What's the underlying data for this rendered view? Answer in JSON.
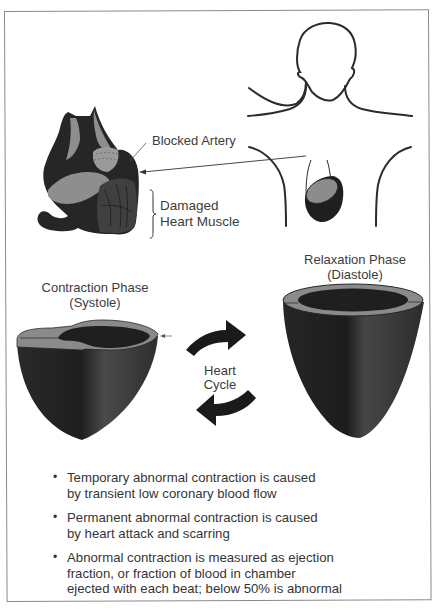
{
  "figure": {
    "labels": {
      "blocked_artery": "Blocked Artery",
      "damaged_heart_muscle": [
        "Damaged",
        "Heart Muscle"
      ],
      "contraction_phase": [
        "Contraction Phase",
        "(Systole)"
      ],
      "relaxation_phase": [
        "Relaxation Phase",
        "(Diastole)"
      ],
      "heart_cycle": [
        "Heart",
        "Cycle"
      ]
    },
    "icons": {
      "body_outline": "human-torso-outline",
      "small_heart": "heart-location-in-chest",
      "cross_section_heart": "damaged-heart-cross-section",
      "systole_heart": "contracted-ventricle",
      "diastole_heart": "relaxed-ventricle",
      "cycle_arrow_forward": "curved-arrow-right",
      "cycle_arrow_back": "curved-arrow-left"
    },
    "colors": {
      "muscle_dark": "#262626",
      "muscle_mid": "#3d3d3d",
      "cut_surface": "#8c8c8c",
      "outline": "#2b2b2b",
      "frame": "#8a8a8a",
      "text": "#3a3a3a"
    }
  },
  "bullets": [
    {
      "lines": [
        "Temporary abnormal contraction is caused",
        "by transient low coronary blood flow"
      ]
    },
    {
      "lines": [
        "Permanent abnormal contraction is caused",
        "by heart attack and scarring"
      ]
    },
    {
      "lines": [
        "Abnormal contraction is measured as ejection",
        "fraction, or fraction of blood in chamber",
        "ejected with each beat; below 50% is abnormal"
      ]
    }
  ],
  "bullet_symbol": "•"
}
